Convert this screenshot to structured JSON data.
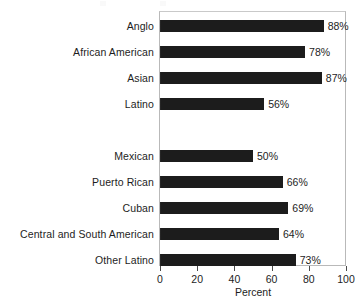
{
  "chart_data": {
    "type": "bar",
    "orientation": "horizontal",
    "title": "",
    "xlabel": "Percent",
    "ylabel": "",
    "xlim": [
      0,
      100
    ],
    "xticks": [
      "0",
      "20",
      "40",
      "60",
      "80",
      "100"
    ],
    "grid": false,
    "legend": "none",
    "value_label_suffix": "%",
    "bar_color": "#1c1c1c",
    "frame_color": "#b9b9b9",
    "groups": [
      {
        "name": "",
        "categories": [
          "Anglo",
          "African American",
          "Asian",
          "Latino"
        ],
        "values": [
          88,
          78,
          87,
          56
        ],
        "value_labels": [
          "88%",
          "78%",
          "87%",
          "56%"
        ]
      },
      {
        "name": "",
        "categories": [
          "Mexican",
          "Puerto Rican",
          "Cuban",
          "Central and South American",
          "Other Latino"
        ],
        "values": [
          50,
          66,
          69,
          64,
          73
        ],
        "value_labels": [
          "50%",
          "66%",
          "69%",
          "64%",
          "73%"
        ]
      }
    ],
    "categories": [
      "Anglo",
      "African American",
      "Asian",
      "Latino",
      "Mexican",
      "Puerto Rican",
      "Cuban",
      "Central and South American",
      "Other Latino"
    ],
    "values": [
      88,
      78,
      87,
      56,
      50,
      66,
      69,
      64,
      73
    ]
  },
  "rows": [
    {
      "label": "Anglo",
      "value": 88,
      "value_label": "88%",
      "spacer": false
    },
    {
      "label": "African American",
      "value": 78,
      "value_label": "78%",
      "spacer": false
    },
    {
      "label": "Asian",
      "value": 87,
      "value_label": "87%",
      "spacer": false
    },
    {
      "label": "Latino",
      "value": 56,
      "value_label": "56%",
      "spacer": false
    },
    {
      "label": "",
      "value": 0,
      "value_label": "",
      "spacer": true
    },
    {
      "label": "Mexican",
      "value": 50,
      "value_label": "50%",
      "spacer": false
    },
    {
      "label": "Puerto Rican",
      "value": 66,
      "value_label": "66%",
      "spacer": false
    },
    {
      "label": "Cuban",
      "value": 69,
      "value_label": "69%",
      "spacer": false
    },
    {
      "label": "Central and South American",
      "value": 64,
      "value_label": "64%",
      "spacer": false
    },
    {
      "label": "Other Latino",
      "value": 73,
      "value_label": "73%",
      "spacer": false
    }
  ],
  "axis": {
    "title": "Percent",
    "ticks": [
      {
        "label": "0",
        "value": 0
      },
      {
        "label": "20",
        "value": 20
      },
      {
        "label": "40",
        "value": 40
      },
      {
        "label": "60",
        "value": 60
      },
      {
        "label": "80",
        "value": 80
      },
      {
        "label": "100",
        "value": 100
      }
    ]
  }
}
